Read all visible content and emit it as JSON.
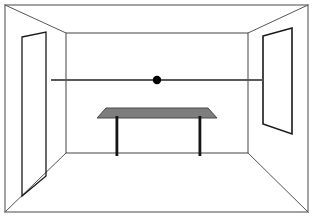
{
  "page": {
    "title": "One-Point Perspective Room Interior",
    "type": "line-drawing",
    "width": 314,
    "height": 219,
    "background_color": "#ffffff"
  },
  "colors": {
    "outline": "#555555",
    "outline_dark": "#1a1a1a",
    "table_top_fill": "#7d7d7d",
    "table_top_stroke": "#4a4a4a",
    "table_leg": "#141414",
    "horizon_line": "#5a5a5a",
    "vanishing_point": "#000000",
    "background": "#ffffff"
  },
  "elements": {
    "outer_frame": {
      "label": "picture-border",
      "x": 5,
      "y": 5,
      "width": 303,
      "height": 207,
      "stroke": "#666666",
      "stroke_width": 1.2
    },
    "back_wall": {
      "label": "back-wall",
      "x": 66,
      "y": 33,
      "width": 182,
      "height": 120,
      "stroke": "#555555",
      "stroke_width": 1.1
    },
    "receding_edges": {
      "label": "corner-recession-lines",
      "lines": [
        {
          "name": "top-left-recede",
          "x1": 5,
          "y1": 5,
          "x2": 66,
          "y2": 33
        },
        {
          "name": "top-right-recede",
          "x1": 308,
          "y1": 5,
          "x2": 248,
          "y2": 33
        },
        {
          "name": "bottom-left-recede",
          "x1": 5,
          "y1": 212,
          "x2": 66,
          "y2": 153
        },
        {
          "name": "bottom-right-recede",
          "x1": 308,
          "y1": 212,
          "x2": 248,
          "y2": 153
        }
      ]
    },
    "horizon_line": {
      "label": "eye-level-horizon-line",
      "x1": 51,
      "y1": 80,
      "x2": 263,
      "y2": 80,
      "stroke_width": 2.0
    },
    "vanishing_point": {
      "label": "vanishing-point-dot",
      "cx": 157,
      "cy": 80,
      "r": 4.2
    },
    "left_door": {
      "label": "left-wall-door-panel",
      "points": "22,37 46,32 46,176 22,196",
      "stroke_width": 1.3
    },
    "right_window": {
      "label": "right-wall-window-panel",
      "points": "263,36 292,28 292,134 263,124",
      "stroke_width": 1.6
    },
    "table": {
      "label": "table",
      "top_points": "97,118 217,118 208,108 106,108",
      "legs": [
        {
          "name": "table-leg-left",
          "x": 115.5,
          "y": 116,
          "width": 2.8,
          "height": 40
        },
        {
          "name": "table-leg-right",
          "x": 198.5,
          "y": 116,
          "width": 2.8,
          "height": 40
        }
      ]
    }
  },
  "chart_data": {
    "type": "diagram",
    "annotations": [
      {
        "name": "vanishing-point",
        "x": 157,
        "y": 80
      },
      {
        "name": "horizon-line-y",
        "value": 80
      }
    ]
  }
}
